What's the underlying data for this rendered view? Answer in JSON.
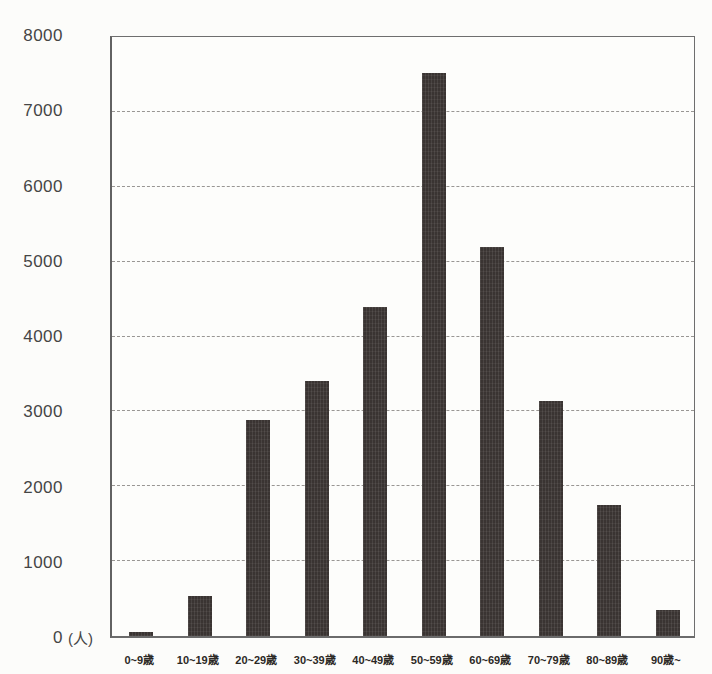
{
  "chart_data": {
    "type": "bar",
    "title": "",
    "xlabel": "",
    "ylabel": "",
    "ylabel_unit": "(人)",
    "ylim": [
      0,
      8000
    ],
    "ytick_interval": 1000,
    "grid": "horizontal-dashed",
    "legend": "none",
    "bar_color": "#3a3432",
    "categories": [
      "0~9歳",
      "10~19歳",
      "20~29歳",
      "30~39歳",
      "40~49歳",
      "50~59歳",
      "60~69歳",
      "70~79歳",
      "80~89歳",
      "90歳~"
    ],
    "category_slugs": [
      "0-9",
      "10-19",
      "20-29",
      "30-39",
      "40-49",
      "50-59",
      "60-69",
      "70-79",
      "80-89",
      "90-plus"
    ],
    "values": [
      50,
      530,
      2880,
      3400,
      4400,
      7520,
      5200,
      3140,
      1750,
      350
    ],
    "yticks": [
      {
        "v": 8000,
        "t": "8000"
      },
      {
        "v": 7000,
        "t": "7000"
      },
      {
        "v": 6000,
        "t": "6000"
      },
      {
        "v": 5000,
        "t": "5000"
      },
      {
        "v": 4000,
        "t": "4000"
      },
      {
        "v": 3000,
        "t": "3000"
      },
      {
        "v": 2000,
        "t": "2000"
      },
      {
        "v": 1000,
        "t": "1000"
      },
      {
        "v": 0,
        "t": "0"
      }
    ]
  }
}
